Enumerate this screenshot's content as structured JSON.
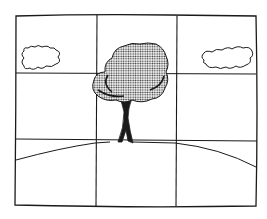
{
  "illustration": {
    "subject": "tree on a hill with two clouds, overlaid with a rule-of-thirds grid",
    "colors": {
      "ink": "#1a1a1a",
      "background": "#ffffff",
      "foliage": "#9a9a9a"
    },
    "grid": {
      "columns": 3,
      "rows": 3
    }
  }
}
